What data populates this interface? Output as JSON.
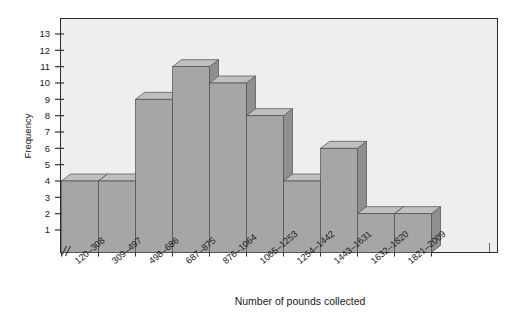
{
  "chart_data": {
    "type": "bar",
    "title": "",
    "subtitle": "",
    "xlabel": "Number of pounds collected",
    "ylabel": "Frequency",
    "categories": [
      "120–308",
      "309–497",
      "498–686",
      "687–875",
      "876–1064",
      "1065–1253",
      "1254–1442",
      "1443–1631",
      "1632–1820",
      "1821–2009"
    ],
    "values": [
      4,
      4,
      9,
      11,
      10,
      8,
      4,
      6,
      2,
      2
    ],
    "ylim": [
      0,
      13
    ],
    "ytick_labels": [
      "13",
      "12",
      "11",
      "10",
      "9",
      "8",
      "7",
      "6",
      "5",
      "4",
      "3",
      "2",
      "1"
    ],
    "ytick_values": [
      13,
      12,
      11,
      10,
      9,
      8,
      7,
      6,
      5,
      4,
      3,
      2,
      1
    ],
    "grid": false,
    "legend": null,
    "axis_break": "⫻",
    "style": "3d-bar-histogram",
    "colors": {
      "bar_front": "#a6a6a6",
      "bar_top": "#bfbfbf",
      "bar_side": "#8f8f8f",
      "bar_outline": "#4d4d4d",
      "plot_background": "#eeeeee",
      "frame": "#2b2b2b",
      "page_background": "#ffffff",
      "text": "#1a1a1a"
    }
  }
}
